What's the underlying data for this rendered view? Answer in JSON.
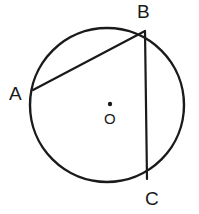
{
  "figure": {
    "type": "circle-geometry-diagram",
    "background_color": "#ffffff",
    "stroke_color": "#1a1a1a",
    "circle": {
      "name": "circle-outline",
      "center_x": 107,
      "center_y": 105,
      "radius": 77,
      "stroke_width": 2.4
    },
    "center_marker": {
      "name": "center-dot",
      "x": 110,
      "y": 104,
      "radius": 2.2
    },
    "points": [
      {
        "id": "A",
        "label": "A",
        "x": 33,
        "y": 90
      },
      {
        "id": "B",
        "label": "B",
        "x": 145,
        "y": 31
      },
      {
        "id": "C",
        "label": "C",
        "x": 147,
        "y": 179
      }
    ],
    "center_point": {
      "id": "O",
      "label": "O"
    },
    "chords": [
      {
        "name": "chord-AB",
        "from": "A",
        "to": "B",
        "x1": 33,
        "y1": 90,
        "x2": 145,
        "y2": 31,
        "stroke_width": 2.2
      },
      {
        "name": "chord-BC",
        "from": "B",
        "to": "C",
        "x1": 145,
        "y1": 31,
        "x2": 147,
        "y2": 179,
        "stroke_width": 2.2
      }
    ],
    "labels": {
      "a": "A",
      "b": "B",
      "c": "C",
      "o": "O"
    }
  }
}
